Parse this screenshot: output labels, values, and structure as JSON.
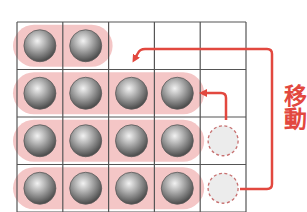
{
  "diagram": {
    "label": "移動",
    "colors": {
      "grid_line": "#555555",
      "highlight": "#f4c6c6",
      "arrow": "#e2483f",
      "ball_dark": "#4a4a4a",
      "ball_light": "#d8d8d8",
      "empty_fill": "#ececec",
      "empty_stroke": "#c77070"
    },
    "grid": {
      "columns": 5,
      "rows": 4,
      "x0": 17,
      "y0": 22,
      "cell_w": 45.8,
      "cell_h": 47.5
    },
    "rows": [
      {
        "balls": 2,
        "empty_slot": false
      },
      {
        "balls": 4,
        "empty_slot": false
      },
      {
        "balls": 4,
        "empty_slot": true
      },
      {
        "balls": 4,
        "empty_slot": true
      }
    ],
    "arrows": [
      {
        "name": "long-move-arrow",
        "from": "row4-col5",
        "to": "row2-top"
      },
      {
        "name": "short-move-arrow",
        "from": "row3-col5",
        "to": "row2-col4"
      }
    ]
  }
}
